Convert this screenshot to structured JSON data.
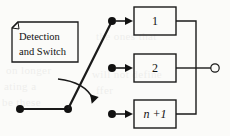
{
  "figure": {
    "background_color": "#fbfbf9",
    "line_color": "#1a1a1a",
    "text_color": "#111111"
  },
  "detection_block": {
    "line1": "Detection",
    "line2": "and Switch",
    "shape": "note-with-folded-corner"
  },
  "channels": [
    {
      "label": "1",
      "italic": false
    },
    {
      "label": "2",
      "italic": false
    },
    {
      "label": "n +1",
      "italic": true
    }
  ],
  "switch": {
    "pivot_label": "switch-pivot",
    "input_terminal_label": "input-terminal",
    "rotation_hint": "curved-arrow"
  },
  "output": {
    "terminal_label": "output-terminal",
    "style": "open-circle"
  },
  "scan_artifacts": [
    {
      "text": "the ones that",
      "x": 96,
      "y": 36
    },
    {
      "text": "on longer",
      "x": 6,
      "y": 70
    },
    {
      "text": "ating a",
      "x": 4,
      "y": 86
    },
    {
      "text": "be these",
      "x": 2,
      "y": 102
    },
    {
      "text": "will not define",
      "x": 92,
      "y": 74
    },
    {
      "text": "ffer",
      "x": 96,
      "y": 90
    }
  ]
}
